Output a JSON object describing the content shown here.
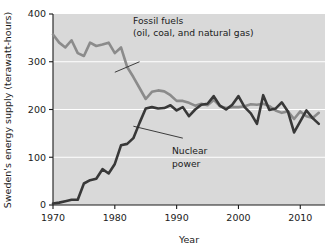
{
  "chart_data": {
    "type": "line",
    "title": "",
    "xlabel": "Year",
    "ylabel": "Sweden's energy supply (terawatt-hours)",
    "xlim": [
      1970,
      2014
    ],
    "ylim": [
      0,
      400
    ],
    "xticks": [
      1970,
      1980,
      1990,
      2000,
      2010
    ],
    "yticks": [
      0,
      100,
      200,
      300,
      400
    ],
    "grid": "horizontal-white-gridlines at 100, 200, 300",
    "legend": "inline annotations with leader lines",
    "plot_background": "#d9d9d9",
    "series": [
      {
        "name": "Fossil fuels (oil, coal, and natural gas)",
        "color": "#8b8b8b",
        "x": [
          1970,
          1971,
          1972,
          1973,
          1974,
          1975,
          1976,
          1977,
          1978,
          1979,
          1980,
          1981,
          1982,
          1983,
          1984,
          1985,
          1986,
          1987,
          1988,
          1989,
          1990,
          1991,
          1992,
          1993,
          1994,
          1995,
          1996,
          1997,
          1998,
          1999,
          2000,
          2001,
          2002,
          2003,
          2004,
          2005,
          2006,
          2007,
          2008,
          2009,
          2010,
          2011,
          2012,
          2013
        ],
        "values": [
          357,
          340,
          330,
          345,
          318,
          312,
          340,
          333,
          336,
          340,
          318,
          330,
          289,
          268,
          245,
          222,
          237,
          240,
          238,
          230,
          218,
          218,
          214,
          208,
          212,
          209,
          220,
          207,
          203,
          205,
          205,
          207,
          211,
          210,
          212,
          207,
          198,
          193,
          196,
          180,
          196,
          186,
          182,
          193
        ]
      },
      {
        "name": "Nuclear power",
        "color": "#383838",
        "x": [
          1970,
          1971,
          1972,
          1973,
          1974,
          1975,
          1976,
          1977,
          1978,
          1979,
          1980,
          1981,
          1982,
          1983,
          1984,
          1985,
          1986,
          1987,
          1988,
          1989,
          1990,
          1991,
          1992,
          1993,
          1994,
          1995,
          1996,
          1997,
          1998,
          1999,
          2000,
          2001,
          2002,
          2003,
          2004,
          2005,
          2006,
          2007,
          2008,
          2009,
          2010,
          2011,
          2012,
          2013
        ],
        "values": [
          3,
          5,
          8,
          11,
          11,
          45,
          52,
          55,
          75,
          66,
          86,
          125,
          128,
          140,
          172,
          202,
          205,
          202,
          203,
          209,
          198,
          205,
          186,
          200,
          210,
          212,
          228,
          208,
          200,
          210,
          228,
          205,
          192,
          170,
          230,
          199,
          202,
          215,
          196,
          152,
          175,
          198,
          182,
          170
        ]
      }
    ],
    "annotations": [
      {
        "name": "fossil-fuels-annotation",
        "lines": [
          "Fossil fuels",
          "(oil, coal, and natural gas)"
        ],
        "leader_from": [
          1984,
          300
        ],
        "leader_to": [
          1980,
          278
        ]
      },
      {
        "name": "nuclear-power-annotation",
        "lines": [
          "Nuclear",
          "power"
        ],
        "leader_from": [
          1991,
          140
        ],
        "leader_to": [
          1983,
          165
        ]
      }
    ]
  },
  "axes": {
    "y_title": "Sweden's energy supply (terawatt-hours)",
    "x_title": "Year",
    "y_tick_labels": [
      "400",
      "300",
      "200",
      "100",
      "0"
    ],
    "x_tick_labels": [
      "1970",
      "1980",
      "1990",
      "2000",
      "2010"
    ]
  },
  "annotation_text": {
    "fossil_line1": "Fossil fuels",
    "fossil_line2": "(oil, coal, and natural gas)",
    "nuclear_line1": "Nuclear",
    "nuclear_line2": "power"
  }
}
